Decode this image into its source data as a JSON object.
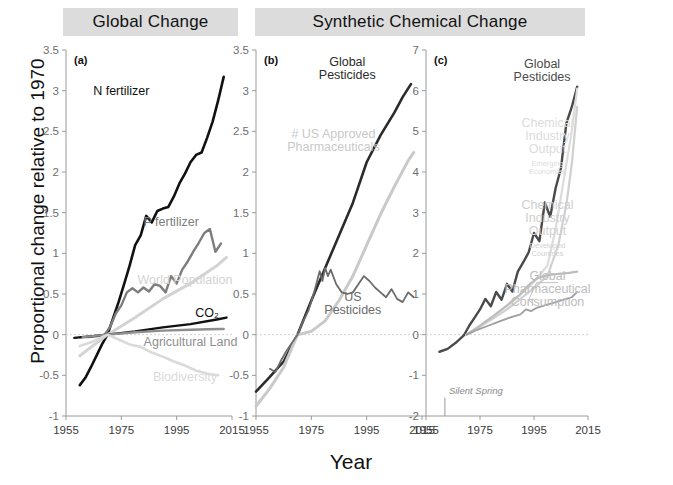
{
  "figure": {
    "ylabel": "Proportional change relative to 1970",
    "xlabel": "Year",
    "headers": [
      {
        "id": "global-change",
        "label": "Global Change"
      },
      {
        "id": "synthetic-chemical-change",
        "label": "Synthetic Chemical Change"
      }
    ]
  },
  "chart_data": [
    {
      "type": "line",
      "panel": "a",
      "panel_label": "(a)",
      "title": "Global Change",
      "xlabel": "Year",
      "ylabel": "Proportional change relative to 1970",
      "xlim": [
        1955,
        2015
      ],
      "ylim": [
        -1,
        3.5
      ],
      "xticks": [
        1955,
        1975,
        1995,
        2015
      ],
      "yticks": [
        -1,
        -0.5,
        0,
        0.5,
        1,
        1.5,
        2,
        2.5,
        3,
        3.5
      ],
      "grid": false,
      "legend": "inline-annotations",
      "series": [
        {
          "name": "N fertilizer",
          "color": "#111111",
          "width": 2.6,
          "label_x": 1975,
          "label_y": 2.95,
          "x": [
            1960,
            1962,
            1964,
            1966,
            1968,
            1970,
            1972,
            1974,
            1976,
            1978,
            1980,
            1982,
            1984,
            1986,
            1988,
            1990,
            1992,
            1994,
            1996,
            1998,
            2000,
            2002,
            2004,
            2006,
            2008,
            2010,
            2012
          ],
          "y": [
            -0.62,
            -0.53,
            -0.4,
            -0.26,
            -0.12,
            0.0,
            0.2,
            0.4,
            0.62,
            0.85,
            1.1,
            1.22,
            1.46,
            1.38,
            1.52,
            1.55,
            1.57,
            1.7,
            1.86,
            1.98,
            2.12,
            2.21,
            2.24,
            2.42,
            2.62,
            2.88,
            3.17
          ]
        },
        {
          "name": "P fertilizer",
          "color": "#7d7d7d",
          "width": 2.4,
          "label_x": 1993,
          "label_y": 1.34,
          "x": [
            1960,
            1963,
            1966,
            1969,
            1971,
            1973,
            1975,
            1977,
            1979,
            1981,
            1983,
            1985,
            1987,
            1989,
            1991,
            1993,
            1995,
            1997,
            1999,
            2001,
            2003,
            2005,
            2007,
            2009,
            2011
          ],
          "y": [
            -0.03,
            -0.03,
            -0.02,
            0.0,
            0.1,
            0.26,
            0.36,
            0.52,
            0.57,
            0.52,
            0.58,
            0.53,
            0.62,
            0.6,
            0.52,
            0.72,
            0.63,
            0.8,
            0.9,
            1.02,
            1.13,
            1.25,
            1.3,
            1.02,
            1.12
          ]
        },
        {
          "name": "World Population",
          "color": "#d3d3d3",
          "width": 3.0,
          "label_x": 1998,
          "label_y": 0.62,
          "x": [
            1960,
            1970,
            1980,
            1990,
            2000,
            2010,
            2013
          ],
          "y": [
            -0.26,
            0.0,
            0.21,
            0.44,
            0.63,
            0.86,
            0.95
          ]
        },
        {
          "name": "CO₂",
          "color": "#111111",
          "width": 2.4,
          "label_x": 2006,
          "label_y": 0.22,
          "x": [
            1958,
            1970,
            1980,
            1990,
            2000,
            2010,
            2013
          ],
          "y": [
            -0.04,
            0.0,
            0.04,
            0.09,
            0.13,
            0.19,
            0.21
          ]
        },
        {
          "name": "Agricultural Land",
          "color": "#8e8e8e",
          "width": 2.4,
          "label_x": 2000,
          "label_y": -0.14,
          "x": [
            1961,
            1970,
            1980,
            1990,
            2000,
            2010,
            2012
          ],
          "y": [
            -0.03,
            0.0,
            0.03,
            0.05,
            0.06,
            0.07,
            0.07
          ]
        },
        {
          "name": "Biodiversity",
          "color": "#dadada",
          "width": 2.6,
          "label_x": 1998,
          "label_y": -0.57,
          "x": [
            1960,
            1965,
            1970,
            1974,
            1978,
            1982,
            1986,
            1990,
            1994,
            1998,
            2002,
            2006,
            2010
          ],
          "y": [
            -0.14,
            -0.08,
            0.0,
            -0.06,
            -0.12,
            -0.15,
            -0.22,
            -0.27,
            -0.33,
            -0.38,
            -0.44,
            -0.48,
            -0.5
          ]
        }
      ]
    },
    {
      "type": "line",
      "panel": "b",
      "panel_label": "(b)",
      "title": "Synthetic Chemical Change",
      "xlabel": "Year",
      "ylabel": "Proportional change relative to 1970",
      "xlim": [
        1955,
        2015
      ],
      "ylim": [
        -1,
        3.5
      ],
      "xticks": [
        1955,
        1975,
        1995,
        2015
      ],
      "yticks": [
        -1,
        -0.5,
        0,
        0.5,
        1,
        1.5,
        2,
        2.5,
        3,
        3.5
      ],
      "grid": false,
      "legend": "inline-annotations",
      "series": [
        {
          "name": "Global Pesticides",
          "color": "#2b2b2b",
          "width": 2.6,
          "label_x": 1988,
          "label_y": 3.3,
          "label_lines": [
            "Global",
            "Pesticides"
          ],
          "x": [
            1955,
            1960,
            1965,
            1970,
            1975,
            1980,
            1985,
            1990,
            1995,
            2000,
            2005,
            2008,
            2011
          ],
          "y": [
            -0.7,
            -0.52,
            -0.33,
            0.0,
            0.42,
            0.82,
            1.22,
            1.62,
            2.12,
            2.45,
            2.73,
            2.92,
            3.08
          ]
        },
        {
          "name": "# US Approved Pharmaceuticals",
          "color": "#c9c9c9",
          "width": 3.0,
          "label_x": 1983,
          "label_y": 2.42,
          "label_lines": [
            "# US Approved",
            "Pharmaceuticals"
          ],
          "x": [
            1955,
            1960,
            1965,
            1970,
            1975,
            1980,
            1985,
            1990,
            1995,
            2000,
            2005,
            2010,
            2012
          ],
          "y": [
            -0.88,
            -0.66,
            -0.4,
            0.0,
            0.04,
            0.17,
            0.42,
            0.72,
            1.1,
            1.48,
            1.82,
            2.14,
            2.24
          ]
        },
        {
          "name": "US Pesticides",
          "color": "#6b6b6b",
          "width": 1.8,
          "label_x": 1990,
          "label_y": 0.42,
          "label_lines": [
            "US",
            "Pesticides"
          ],
          "x": [
            1960,
            1962,
            1964,
            1966,
            1968,
            1970,
            1972,
            1974,
            1976,
            1978,
            1979,
            1980,
            1981,
            1982,
            1984,
            1986,
            1988,
            1990,
            1992,
            1994,
            1996,
            1998,
            2000,
            2002,
            2004,
            2006,
            2008,
            2010,
            2012
          ],
          "y": [
            -0.42,
            -0.46,
            -0.32,
            -0.2,
            -0.1,
            0.0,
            0.16,
            0.3,
            0.52,
            0.78,
            0.66,
            0.82,
            0.72,
            0.8,
            0.62,
            0.52,
            0.5,
            0.52,
            0.62,
            0.72,
            0.66,
            0.58,
            0.52,
            0.46,
            0.56,
            0.44,
            0.4,
            0.52,
            0.46
          ]
        }
      ]
    },
    {
      "type": "line",
      "panel": "c",
      "panel_label": "(c)",
      "title": "Synthetic Chemical Change",
      "xlabel": "Year",
      "ylabel": "Proportional change relative to 1970",
      "xlim": [
        1955,
        2015
      ],
      "ylim": [
        -2,
        7
      ],
      "xticks": [
        1955,
        1975,
        1995,
        2015
      ],
      "yticks": [
        -2,
        -1,
        0,
        1,
        2,
        3,
        4,
        5,
        6,
        7
      ],
      "grid": false,
      "legend": "inline-annotations",
      "annotations": [
        {
          "name": "silent-spring",
          "text": "Silent Spring",
          "x": 1962,
          "y": -1.45
        }
      ],
      "series": [
        {
          "name": "Global Pesticides",
          "color": "#4a4a4a",
          "width": 2.4,
          "label_x": 1998,
          "label_y": 6.55,
          "label_lines": [
            "Global",
            "Pesticides"
          ],
          "x": [
            1960,
            1963,
            1966,
            1969,
            1971,
            1973,
            1975,
            1977,
            1979,
            1981,
            1983,
            1985,
            1987,
            1989,
            1991,
            1993,
            1995,
            1997,
            1999,
            2001,
            2003,
            2005,
            2007,
            2009,
            2011
          ],
          "y": [
            -0.42,
            -0.35,
            -0.2,
            -0.02,
            0.22,
            0.42,
            0.62,
            0.88,
            0.7,
            1.05,
            0.86,
            1.25,
            1.06,
            1.55,
            1.78,
            2.02,
            2.5,
            2.3,
            3.25,
            2.9,
            3.6,
            4.1,
            5.2,
            5.6,
            6.1
          ]
        },
        {
          "name": "Chemical Industry Output Emerging Economies",
          "color": "#dcdcdc",
          "width": 2.2,
          "label_x": 2000,
          "label_y": 5.1,
          "label_lines": [
            "Chemical",
            "Industry",
            "Output"
          ],
          "sub_lines": [
            "Emerging",
            "Economies"
          ],
          "x": [
            1970,
            1975,
            1980,
            1985,
            1990,
            1995,
            2000,
            2003,
            2006,
            2009,
            2011
          ],
          "y": [
            0.0,
            0.22,
            0.46,
            0.7,
            0.98,
            1.3,
            1.7,
            2.6,
            3.8,
            5.0,
            6.05
          ]
        },
        {
          "name": "Chemical Industry Output Developed Countries",
          "color": "#d0d0d0",
          "width": 2.2,
          "label_x": 2000,
          "label_y": 3.1,
          "label_lines": [
            "Chemical",
            "Industry",
            "Output"
          ],
          "sub_lines": [
            "Developed",
            "Countries"
          ],
          "x": [
            1970,
            1975,
            1980,
            1985,
            1990,
            1995,
            2000,
            2004,
            2007,
            2009,
            2011
          ],
          "y": [
            0.0,
            0.2,
            0.4,
            0.62,
            0.88,
            1.15,
            1.45,
            2.2,
            3.2,
            4.2,
            5.6
          ]
        },
        {
          "name": "Global Pharmaceutical Consumption",
          "color": "#bdbdbd",
          "width": 2.2,
          "label_x": 2000,
          "label_y": 1.35,
          "label_lines": [
            "Global",
            "Pharmaceutical",
            "Consumption"
          ],
          "x": [
            1970,
            1975,
            1980,
            1985,
            1990,
            1993,
            1996,
            1999,
            2002,
            2005,
            2008,
            2011
          ],
          "y": [
            0.0,
            0.22,
            0.46,
            0.72,
            1.0,
            1.22,
            1.38,
            1.45,
            1.48,
            1.5,
            1.52,
            1.55
          ]
        },
        {
          "name": "Global Pharmaceutical Consumption lower",
          "color": "#9e9e9e",
          "width": 1.8,
          "x": [
            1970,
            1974,
            1978,
            1982,
            1986,
            1990,
            1992,
            1994,
            1996,
            1998,
            2000,
            2003,
            2006,
            2009,
            2011
          ],
          "y": [
            0.0,
            0.12,
            0.22,
            0.32,
            0.42,
            0.5,
            0.62,
            0.58,
            0.66,
            0.7,
            0.74,
            0.8,
            0.86,
            0.92,
            1.05
          ]
        }
      ]
    }
  ]
}
